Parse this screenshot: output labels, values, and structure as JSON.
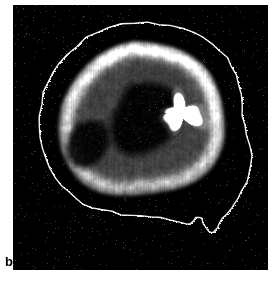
{
  "figure": {
    "panel_label": "b",
    "modality": "nuclear-medicine-brain-perfusion-scan",
    "view": "sagittal",
    "caption_text": "b",
    "panel": {
      "background_color": "#000000",
      "outer_background_color": "#ffffff",
      "x": 13,
      "y": 5,
      "width": 255,
      "height": 265
    },
    "colors": {
      "background": "#000000",
      "page": "#ffffff",
      "contour_line": "#f2f2f2",
      "cortex_high": "#e8e8e8",
      "cortex_mid": "#9a9a9a",
      "cortex_low": "#3a3a3a",
      "hotspot": "#ffffff",
      "label_text": "#000000"
    },
    "features": [
      {
        "name": "scalp-contour",
        "description": "Thin white traced outline of the head / scalp enclosing the whole brain, with small irregular bumps along the superior margin and a notch near the inferior anterior region",
        "color": "#f2f2f2"
      },
      {
        "name": "cortical-ribbon",
        "description": "Bright gray-white band of tracer uptake following the cortical surface, brightest superiorly and posteriorly",
        "color": "#dcdcdc"
      },
      {
        "name": "central-white-matter",
        "description": "Dark low-uptake region in the brain interior",
        "color": "#141414"
      },
      {
        "name": "focal-hotspot",
        "description": "Saturated pure-white focal region of intense uptake in the central brain, irregular wedge shape",
        "color": "#ffffff",
        "approx_center_x": 180,
        "approx_center_y": 112
      },
      {
        "name": "temporal-lobe-ribbon",
        "description": "Hook-shaped bright band curving through the inferior anterior brain",
        "color": "#c8c8c8"
      },
      {
        "name": "inferior-notch",
        "description": "V-shaped notch in the contour along the inferior-posterior edge",
        "color": "#f2f2f2"
      }
    ]
  }
}
